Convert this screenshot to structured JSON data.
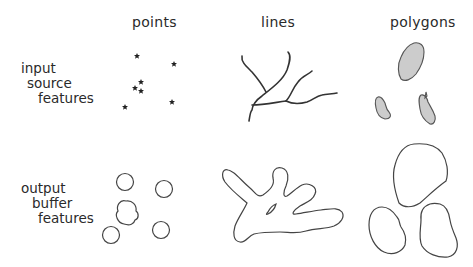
{
  "columns": [
    {
      "key": "points",
      "label": "points"
    },
    {
      "key": "lines",
      "label": "lines"
    },
    {
      "key": "polygons",
      "label": "polygons"
    }
  ],
  "rows": [
    {
      "key": "input",
      "label_lines": [
        "input",
        "source",
        "features"
      ]
    },
    {
      "key": "output",
      "label_lines": [
        "output",
        "buffer",
        "features"
      ]
    }
  ],
  "colors": {
    "stroke": "#333333",
    "polygon_fill": "#cccccc",
    "text": "#2a2a2a",
    "background": "#ffffff"
  },
  "input_points": [
    [
      137,
      56
    ],
    [
      174,
      64
    ],
    [
      141,
      82
    ],
    [
      135,
      88
    ],
    [
      141,
      91
    ],
    [
      125,
      107
    ],
    [
      172,
      102
    ]
  ]
}
